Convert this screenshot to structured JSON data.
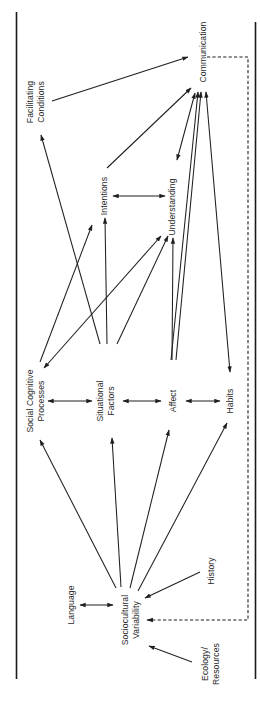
{
  "diagram": {
    "title": "",
    "orientation": "rotated-90-ccw",
    "colors": {
      "ink": "#1f1f1f",
      "background": "#ffffff"
    },
    "nodes": {
      "communication": {
        "line1": "Communication",
        "line2": ""
      },
      "facilitating_conditions": {
        "line1": "Facilitating",
        "line2": "Conditions"
      },
      "intentions": {
        "line1": "Intentions",
        "line2": ""
      },
      "understanding": {
        "line1": "Understanding",
        "line2": ""
      },
      "social_cognitive_processes": {
        "line1": "Social Cognitive",
        "line2": "Processes"
      },
      "situational_factors": {
        "line1": "Situational",
        "line2": "Factors"
      },
      "affect": {
        "line1": "Affect",
        "line2": ""
      },
      "habits": {
        "line1": "Habits",
        "line2": ""
      },
      "language": {
        "line1": "Language",
        "line2": ""
      },
      "sociocultural_variability": {
        "line1": "Sociocultural",
        "line2": "Variability"
      },
      "history": {
        "line1": "History",
        "line2": ""
      },
      "ecology_resources": {
        "line1": "Ecology/",
        "line2": "Resources"
      }
    },
    "edges": [
      {
        "from": "Facilitating Conditions",
        "to": "Communication",
        "type": "directed"
      },
      {
        "from": "Intentions",
        "to": "Communication",
        "type": "directed"
      },
      {
        "from": "Communication",
        "to": "Understanding",
        "type": "bidirectional"
      },
      {
        "from": "Affect",
        "to": "Communication",
        "type": "directed"
      },
      {
        "from": "Habits",
        "to": "Communication",
        "type": "bidirectional"
      },
      {
        "from": "Intentions",
        "to": "Understanding",
        "type": "bidirectional"
      },
      {
        "from": "Situational Factors",
        "to": "Facilitating Conditions",
        "type": "directed"
      },
      {
        "from": "Situational Factors",
        "to": "Intentions",
        "type": "directed"
      },
      {
        "from": "Situational Factors",
        "to": "Understanding",
        "type": "directed"
      },
      {
        "from": "Social Cognitive Processes",
        "to": "Intentions",
        "type": "directed"
      },
      {
        "from": "Social Cognitive Processes",
        "to": "Understanding",
        "type": "bidirectional"
      },
      {
        "from": "Affect",
        "to": "Understanding",
        "type": "directed"
      },
      {
        "from": "Social Cognitive Processes",
        "to": "Situational Factors",
        "type": "bidirectional"
      },
      {
        "from": "Situational Factors",
        "to": "Affect",
        "type": "bidirectional"
      },
      {
        "from": "Affect",
        "to": "Habits",
        "type": "bidirectional"
      },
      {
        "from": "Sociocultural Variability",
        "to": "Social Cognitive Processes",
        "type": "directed"
      },
      {
        "from": "Sociocultural Variability",
        "to": "Situational Factors",
        "type": "directed"
      },
      {
        "from": "Sociocultural Variability",
        "to": "Affect",
        "type": "directed"
      },
      {
        "from": "Sociocultural Variability",
        "to": "Habits",
        "type": "directed"
      },
      {
        "from": "Language",
        "to": "Sociocultural Variability",
        "type": "bidirectional"
      },
      {
        "from": "History",
        "to": "Sociocultural Variability",
        "type": "directed"
      },
      {
        "from": "Ecology/Resources",
        "to": "Sociocultural Variability",
        "type": "directed"
      },
      {
        "from": "Communication",
        "to": "Sociocultural Variability",
        "type": "feedback-dashed"
      }
    ]
  }
}
